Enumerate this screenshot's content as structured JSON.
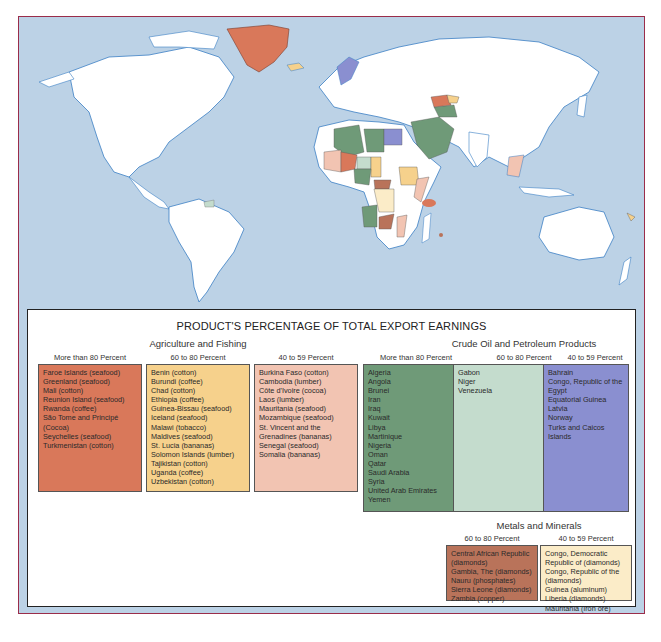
{
  "legend": {
    "title": "PRODUCT'S PERCENTAGE OF TOTAL EXPORT EARNINGS",
    "groups": [
      {
        "title": "Agriculture and Fishing",
        "columns": [
          {
            "heading": "More than 80 Percent",
            "color": "#d9785a",
            "items": [
              "Faroe Islands (seafood)",
              "Greenland (seafood)",
              "Mali (cotton)",
              "Reunion Island (seafood)",
              "Rwanda (coffee)",
              "São Tome and Principé (Cocoa)",
              "Seychelles (seafood)",
              "Turkmenistan (cotton)"
            ]
          },
          {
            "heading": "60 to 80 Percent",
            "color": "#f6d18c",
            "items": [
              "Benin (cotton)",
              "Burundi (coffee)",
              "Chad (cotton)",
              "Ethiopia (coffee)",
              "Guinea-Bissau (seafood)",
              "Iceland (seafood)",
              "Malawi (tobacco)",
              "Maldives (seafood)",
              "St. Lucia (bananas)",
              "Solomon Islands (lumber)",
              "Tajikistan (cotton)",
              "Uganda (coffee)",
              "Uzbekistan (cotton)"
            ]
          },
          {
            "heading": "40 to 59 Percent",
            "color": "#f2c4b2",
            "items": [
              "Burkina Faso (cotton)",
              "Cambodia (lumber)",
              "Côte d'Ivoire (cocoa)",
              "Laos (lumber)",
              "Mauritania (seafood)",
              "Mozambique (seafood)",
              "St. Vincent and the Grenadines (bananas)",
              "Senegal (seafood)",
              "Somalia (bananas)"
            ]
          }
        ]
      },
      {
        "title": "Crude Oil and Petroleum Products",
        "columns": [
          {
            "heading": "More than 80 Percent",
            "color": "#6f9a78",
            "items": [
              "Algeria",
              "Angola",
              "Brunei",
              "Iran",
              "Iraq",
              "Kuwait",
              "Libya",
              "Martinique",
              "Nigeria",
              "Oman",
              "Qatar",
              "Saudi Arabia",
              "Syria",
              "United Arab Emirates",
              "Yemen"
            ]
          },
          {
            "heading": "60 to 80 Percent",
            "color": "#c4dccd",
            "items": [
              "Gabon",
              "Niger",
              "Venezuela"
            ]
          },
          {
            "heading": "40 to 59 Percent",
            "color": "#8a8fd0",
            "items": [
              "Bahrain",
              "Congo, Republic of the",
              "Egypt",
              "Equatorial Guinea",
              "Latvia",
              "Norway",
              "Turks and Caicos Islands"
            ]
          }
        ]
      },
      {
        "title": "Metals and Minerals",
        "columns": [
          {
            "heading": "60 to 80 Percent",
            "color": "#b9735a",
            "items": [
              "Central African Republic (diamonds)",
              "Gambia, The (diamonds)",
              "Nauru (phosphates)",
              "Sierra Leone (diamonds)",
              "Zambia (copper)"
            ]
          },
          {
            "heading": "40 to 59 Percent",
            "color": "#fbecc8",
            "items": [
              "Congo, Democratic Republic of (diamonds)",
              "Congo, Republic of the (diamonds)",
              "Guinea (aluminum)",
              "Liberia (diamonds)",
              "Mauritania (iron ore)"
            ]
          }
        ]
      }
    ]
  },
  "map": {
    "ocean_color": "#bcd2e6",
    "land_color": "#ffffff",
    "coast_color": "#3b7fc4",
    "frame_color": "#9a2d4a"
  }
}
